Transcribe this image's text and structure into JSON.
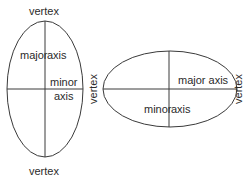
{
  "diagram": {
    "stroke_color": "#3a3a3a",
    "text_color": "#2b2b2b",
    "vertical_ellipse": {
      "top_vertex_label": "vertex",
      "bottom_vertex_label": "vertex",
      "major_label_part1": "major",
      "major_label_part2": "axis",
      "minor_label_line1": "minor",
      "minor_label_line2": "axis",
      "center": [
        45,
        89
      ],
      "rx": 38,
      "ry": 68
    },
    "horizontal_ellipse": {
      "left_vertex_label": "vertex",
      "right_vertex_label": "vertex",
      "major_label": "major axis",
      "minor_label_part1": "minor",
      "minor_label_part2": "axis",
      "center": [
        170,
        89
      ],
      "rx": 67,
      "ry": 38
    }
  }
}
